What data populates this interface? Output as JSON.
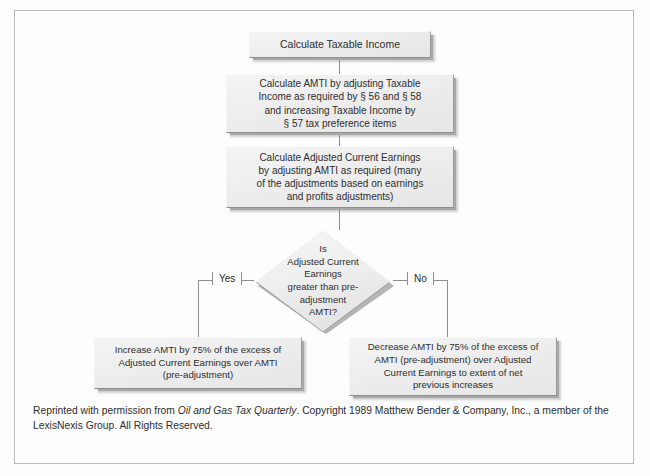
{
  "diagram": {
    "nodes": {
      "taxable_income": "Calculate Taxable Income",
      "amti": "Calculate AMTI by adjusting Taxable\nIncome as required by § 56 and § 58\nand increasing Taxable Income by\n§ 57 tax preference items",
      "ace": "Calculate Adjusted Current Earnings\nby adjusting AMTI as required (many\nof the adjustments based on earnings\nand profits adjustments)",
      "decision": "Is\nAdjusted Current\nEarnings\ngreater than pre-\nadjustment\nAMTI?",
      "increase": "Increase AMTI by 75% of the excess of\nAdjusted Current Earnings over AMTI\n(pre-adjustment)",
      "decrease": "Decrease AMTI by 75% of the excess of\nAMTI (pre-adjustment) over Adjusted\nCurrent Earnings to extent of net\nprevious increases"
    },
    "branches": {
      "yes": "Yes",
      "no": "No"
    }
  },
  "footer": {
    "line_before_italic": "Reprinted with permission from ",
    "italic_title": "Oil and Gas Tax Quarterly",
    "line_after_italic": ". Copyright 1989 Matthew Bender & Company, Inc., a member of the LexisNexis Group. All Rights Reserved."
  },
  "colors": {
    "node_fill": "#ececec",
    "node_shadow": "#a8a8a8",
    "connector": "#8e8e8e",
    "frame_border": "#b9b9b9",
    "text": "#2e2e2e",
    "background": "#fdfdfd"
  }
}
